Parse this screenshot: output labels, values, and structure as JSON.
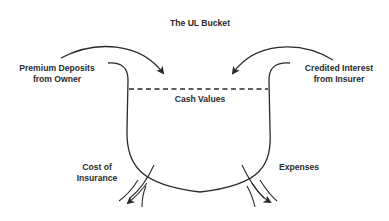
{
  "title": "The UL Bucket",
  "labels": {
    "inflow_left": [
      "Premium Deposits",
      "from Owner"
    ],
    "inflow_right": [
      "Credited Interest",
      "from Insurer"
    ],
    "level": "Cash Values",
    "outflow_left": [
      "Cost of",
      "Insurance"
    ],
    "outflow_right": "Expenses"
  },
  "colors": {
    "stroke": "#2a2a2a",
    "background": "#ffffff"
  }
}
